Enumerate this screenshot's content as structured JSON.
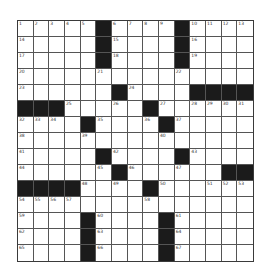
{
  "puzzle": {
    "rows": 15,
    "cols": 15,
    "colors": {
      "block": "#1b1b1b",
      "cell": "#ffffff",
      "line": "#555555"
    },
    "layout": [
      "#####B####B####",
      "#####B####B####",
      "#####B####B####",
      "###############",
      "######B####BBBB",
      "BBB#####B######",
      "####B####B#####",
      "###############",
      "#####B####B####",
      "######B######BB",
      "BBBB####B######",
      "###############",
      "####B####B#####",
      "####B####B#####",
      "####B####B#####"
    ],
    "numbers": [
      [
        1,
        2,
        3,
        4,
        5,
        null,
        6,
        7,
        8,
        9,
        null,
        10,
        11,
        12,
        13
      ],
      [
        14,
        null,
        null,
        null,
        null,
        null,
        15,
        null,
        null,
        null,
        null,
        16,
        null,
        null,
        null
      ],
      [
        17,
        null,
        null,
        null,
        null,
        null,
        18,
        null,
        null,
        null,
        null,
        19,
        null,
        null,
        null
      ],
      [
        20,
        null,
        null,
        null,
        null,
        21,
        null,
        null,
        null,
        null,
        22,
        null,
        null,
        null,
        null
      ],
      [
        23,
        null,
        null,
        null,
        null,
        null,
        null,
        24,
        null,
        null,
        null,
        null,
        null,
        null,
        null
      ],
      [
        null,
        null,
        null,
        25,
        null,
        null,
        26,
        null,
        null,
        27,
        null,
        28,
        29,
        30,
        31
      ],
      [
        32,
        33,
        34,
        null,
        null,
        35,
        null,
        null,
        36,
        null,
        37,
        null,
        null,
        null,
        null
      ],
      [
        38,
        null,
        null,
        null,
        39,
        null,
        null,
        null,
        null,
        40,
        null,
        null,
        null,
        null,
        null
      ],
      [
        41,
        null,
        null,
        null,
        null,
        null,
        42,
        null,
        null,
        null,
        null,
        43,
        null,
        null,
        null
      ],
      [
        44,
        null,
        null,
        null,
        null,
        45,
        null,
        46,
        null,
        null,
        47,
        null,
        null,
        null,
        null
      ],
      [
        null,
        null,
        null,
        null,
        48,
        null,
        49,
        null,
        null,
        50,
        null,
        null,
        51,
        52,
        53
      ],
      [
        54,
        55,
        56,
        57,
        null,
        null,
        null,
        null,
        58,
        null,
        null,
        null,
        null,
        null,
        null
      ],
      [
        59,
        null,
        null,
        null,
        null,
        60,
        null,
        null,
        null,
        null,
        61,
        null,
        null,
        null,
        null
      ],
      [
        62,
        null,
        null,
        null,
        null,
        63,
        null,
        null,
        null,
        null,
        64,
        null,
        null,
        null,
        null
      ],
      [
        65,
        null,
        null,
        null,
        null,
        66,
        null,
        null,
        null,
        null,
        67,
        null,
        null,
        null,
        null
      ]
    ]
  }
}
